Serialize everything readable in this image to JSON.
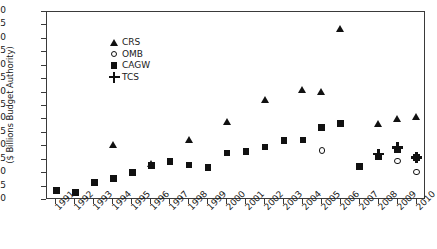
{
  "chart_data": {
    "type": "scatter",
    "title": "",
    "xlabel": "",
    "ylabel": "($ Billions Budget Authority)",
    "ylim": [
      0,
      70
    ],
    "ytick_step": 5,
    "grid": false,
    "legend_position": "upper-left",
    "categories": [
      "1991",
      "1992",
      "1993",
      "1994",
      "1995",
      "1996",
      "1997",
      "1998",
      "1999",
      "2000",
      "2001",
      "2002",
      "2003",
      "2004",
      "2005",
      "2006",
      "2007",
      "2008",
      "2009",
      "2010"
    ],
    "yticks": [
      "0",
      "5",
      "10",
      "15",
      "20",
      "25",
      "30",
      "35",
      "40",
      "45",
      "50",
      "55",
      "60",
      "65",
      "70"
    ],
    "series": [
      {
        "name": "CRS",
        "marker": "filled-triangle",
        "color": "#111111",
        "values": [
          null,
          null,
          null,
          20.5,
          null,
          13.5,
          null,
          22.3,
          null,
          29.0,
          null,
          37.3,
          null,
          41.0,
          40.3,
          63.5,
          null,
          28.2,
          30.0,
          31.0
        ]
      },
      {
        "name": "OMB",
        "marker": "open-circle",
        "color": "#111111",
        "values": [
          null,
          null,
          null,
          null,
          null,
          null,
          null,
          null,
          null,
          null,
          null,
          null,
          null,
          null,
          18.4,
          null,
          null,
          16.0,
          14.6,
          10.3
        ]
      },
      {
        "name": "CAGW",
        "marker": "filled-square",
        "color": "#111111",
        "values": [
          3.5,
          2.8,
          6.6,
          8.0,
          10.2,
          12.8,
          14.3,
          13.1,
          12.0,
          17.5,
          18.0,
          19.8,
          22.1,
          22.4,
          26.9,
          28.5,
          12.5,
          16.3,
          18.8,
          15.8
        ]
      },
      {
        "name": "TCS",
        "marker": "plus",
        "color": "#111111",
        "values": [
          null,
          null,
          null,
          null,
          null,
          null,
          null,
          null,
          null,
          null,
          null,
          null,
          null,
          null,
          null,
          null,
          null,
          17.0,
          19.5,
          15.8
        ]
      }
    ]
  },
  "legend": {
    "items": [
      {
        "label": "CRS",
        "marker": "filled-triangle"
      },
      {
        "label": "OMB",
        "marker": "open-circle"
      },
      {
        "label": "CAGW",
        "marker": "filled-square"
      },
      {
        "label": "TCS",
        "marker": "plus"
      }
    ]
  }
}
